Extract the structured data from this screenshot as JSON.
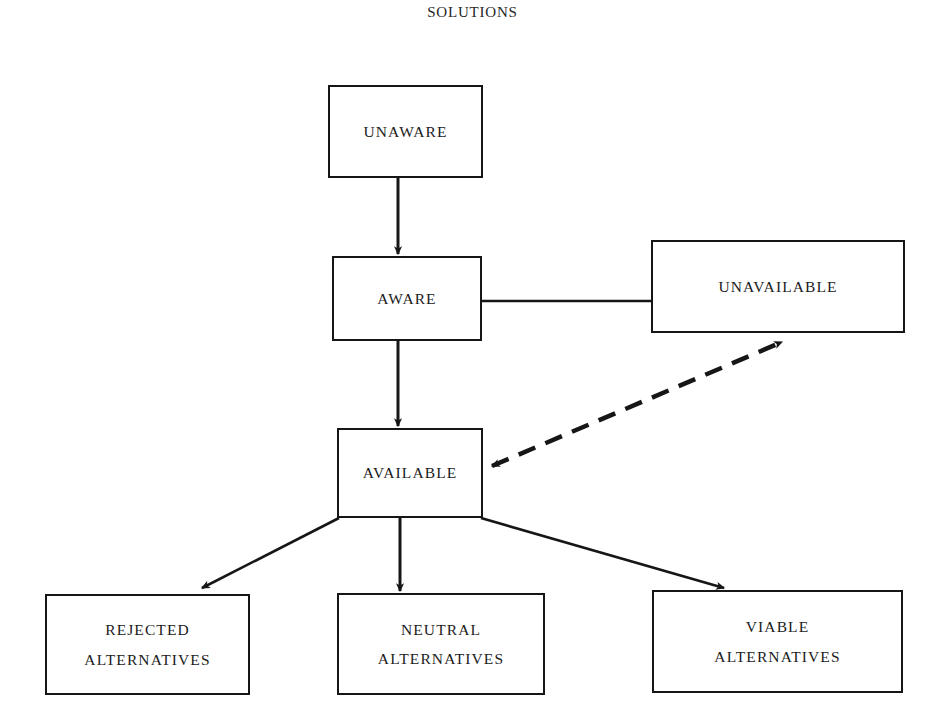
{
  "diagram": {
    "title": "SOLUTIONS",
    "background_color": "#ffffff",
    "line_color": "#161616",
    "text_color": "#1b1b1b",
    "nodes": [
      {
        "id": "unaware",
        "label": "UNAWARE",
        "line1": "UNAWARE",
        "line2": "",
        "x": 328,
        "y": 85,
        "w": 155,
        "h": 93
      },
      {
        "id": "aware",
        "label": "AWARE",
        "line1": "AWARE",
        "line2": "",
        "x": 332,
        "y": 256,
        "w": 150,
        "h": 85
      },
      {
        "id": "unavailable",
        "label": "UNAVAILABLE",
        "line1": "UNAVAILABLE",
        "line2": "",
        "x": 651,
        "y": 240,
        "w": 254,
        "h": 93
      },
      {
        "id": "available",
        "label": "AVAILABLE",
        "line1": "AVAILABLE",
        "line2": "",
        "x": 337,
        "y": 428,
        "w": 146,
        "h": 90
      },
      {
        "id": "rejected",
        "label": "REJECTED ALTERNATIVES",
        "line1": "REJECTED",
        "line2": "ALTERNATIVES",
        "x": 45,
        "y": 594,
        "w": 205,
        "h": 101
      },
      {
        "id": "neutral",
        "label": "NEUTRAL ALTERNATIVES",
        "line1": "NEUTRAL",
        "line2": "ALTERNATIVES",
        "x": 337,
        "y": 593,
        "w": 208,
        "h": 102
      },
      {
        "id": "viable",
        "label": "VIABLE ALTERNATIVES",
        "line1": "VIABLE",
        "line2": "ALTERNATIVES",
        "x": 652,
        "y": 590,
        "w": 251,
        "h": 103
      }
    ],
    "edges": [
      {
        "id": "unaware-to-aware",
        "from": "unaware",
        "to": "aware",
        "style": "solid",
        "arrows": "end"
      },
      {
        "id": "aware-to-unavailable",
        "from": "aware",
        "to": "unavailable",
        "style": "solid",
        "arrows": "none"
      },
      {
        "id": "aware-to-available",
        "from": "aware",
        "to": "available",
        "style": "solid",
        "arrows": "end"
      },
      {
        "id": "available-to-unavailable",
        "from": "available",
        "to": "unavailable",
        "style": "dashed",
        "arrows": "both"
      },
      {
        "id": "available-to-rejected",
        "from": "available",
        "to": "rejected",
        "style": "solid",
        "arrows": "end"
      },
      {
        "id": "available-to-neutral",
        "from": "available",
        "to": "neutral",
        "style": "solid",
        "arrows": "end"
      },
      {
        "id": "available-to-viable",
        "from": "available",
        "to": "viable",
        "style": "solid",
        "arrows": "end"
      }
    ]
  }
}
